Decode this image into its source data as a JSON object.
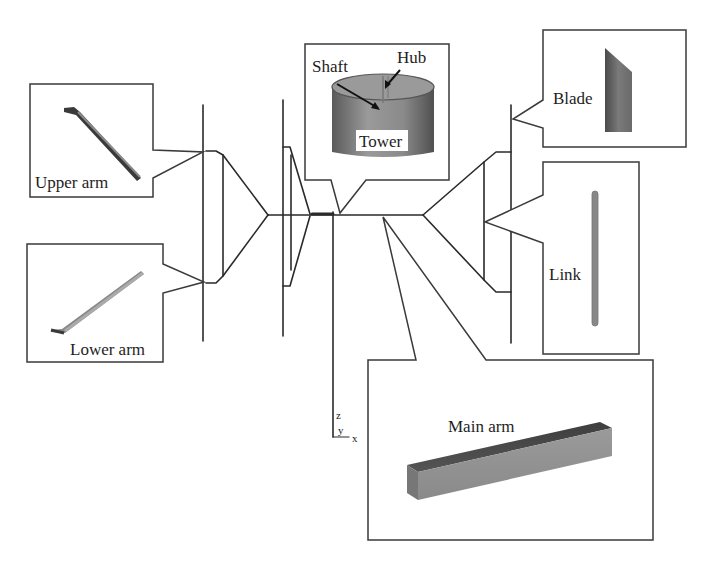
{
  "diagram": {
    "type": "structural model of vertical-axis wind turbine",
    "components": [
      {
        "id": "upper-arm",
        "label": "Upper arm"
      },
      {
        "id": "lower-arm",
        "label": "Lower arm"
      },
      {
        "id": "tower",
        "label": "Tower"
      },
      {
        "id": "shaft",
        "label": "Shaft"
      },
      {
        "id": "hub",
        "label": "Hub"
      },
      {
        "id": "blade",
        "label": "Blade"
      },
      {
        "id": "link",
        "label": "Link"
      },
      {
        "id": "main-arm",
        "label": "Main arm"
      }
    ],
    "axes": {
      "z": "z",
      "y": "y",
      "x": "x"
    },
    "colors": {
      "line": "#2a2a2a",
      "part_dark": "#4a4a4a",
      "part_mid": "#8a8a8a",
      "part_light": "#b5b5b5"
    }
  }
}
